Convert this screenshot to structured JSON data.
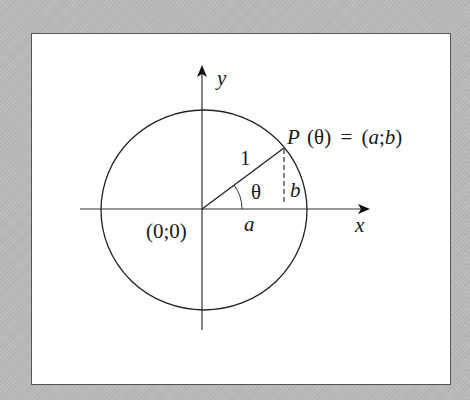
{
  "diagram": {
    "axes": {
      "x_label": "x",
      "y_label": "y"
    },
    "origin_label": "(0;0)",
    "radius_label": "1",
    "angle_label": "θ",
    "horizontal_leg_label": "a",
    "vertical_leg_label": "b",
    "point": {
      "name": "P",
      "arg": "(θ)",
      "equals": "=",
      "coords_open": "(",
      "coord_a": "a",
      "sep": ";",
      "coord_b": "b",
      "coords_close": ")"
    },
    "colors": {
      "background": "#b9b9b9",
      "panel": "#ffffff",
      "stroke": "#222222"
    }
  }
}
